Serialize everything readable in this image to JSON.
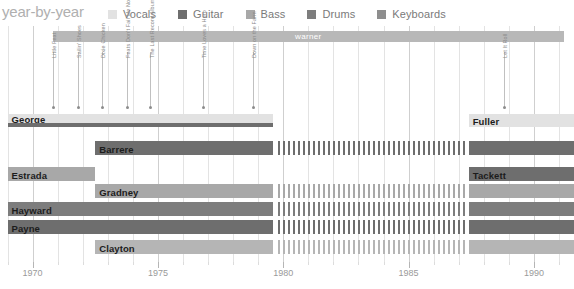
{
  "header": {
    "title": "year-by-year",
    "legend": [
      {
        "label": "Vocals",
        "color": "#e2e2e2"
      },
      {
        "label": "Guitar",
        "color": "#6e6e6e"
      },
      {
        "label": "Bass",
        "color": "#a8a8a8"
      },
      {
        "label": "Drums",
        "color": "#7d7d7d"
      },
      {
        "label": "Keyboards",
        "color": "#8e8e8e"
      }
    ]
  },
  "label_bands": [
    {
      "name": "warner",
      "start_year": 1970.8,
      "end_year": 1991.2,
      "color": "#b8b8b8"
    }
  ],
  "albums": [
    {
      "name": "Little Feat",
      "year": 1970.8
    },
    {
      "name": "Sailin' Shoes",
      "year": 1971.8
    },
    {
      "name": "Dixie Chicken",
      "year": 1972.75
    },
    {
      "name": "Feats Don't Fail Me Now",
      "year": 1973.75
    },
    {
      "name": "The Last Record Album",
      "year": 1974.7
    },
    {
      "name": "Time Loves a Hero",
      "year": 1976.8
    },
    {
      "name": "Down on the Farm",
      "year": 1978.8
    },
    {
      "name": "Let It Roll",
      "year": 1988.8
    }
  ],
  "axis": {
    "ticks_major": [
      1970,
      1975,
      1980,
      1985,
      1990
    ],
    "tick_labels": [
      "1970",
      "1975",
      "1980",
      "1985",
      "1990"
    ],
    "year_min": 1968.7,
    "year_max": 1991.6,
    "minor_step": 1
  },
  "chart_data": {
    "type": "bar",
    "title": "year-by-year",
    "xlabel": "",
    "ylabel": "",
    "xlim": [
      1968.7,
      1991.6
    ],
    "grid": true,
    "legend_position": "top",
    "categories": [
      "George",
      "Barrere",
      "Estrada",
      "Gradney",
      "Hayward",
      "Payne",
      "Clayton",
      "Fuller",
      "Tackett"
    ],
    "series": [
      {
        "name": "Vocals",
        "color": "#e2e2e2"
      },
      {
        "name": "Guitar",
        "color": "#6e6e6e"
      },
      {
        "name": "Bass",
        "color": "#a8a8a8"
      },
      {
        "name": "Drums",
        "color": "#7d7d7d"
      },
      {
        "name": "Keyboards",
        "color": "#8e8e8e"
      }
    ],
    "rows": [
      {
        "member": "George",
        "row": 0,
        "label_on": "vocals",
        "segments": [
          {
            "instrument": "Vocals",
            "color": "#e2e2e2",
            "start": 1969.0,
            "end": 1979.6,
            "y": 0,
            "h": 9,
            "dashed": false
          },
          {
            "instrument": "Guitar",
            "color": "#6e6e6e",
            "start": 1969.0,
            "end": 1979.6,
            "y": 9,
            "h": 4,
            "dashed": false
          }
        ]
      },
      {
        "member": "Barrere",
        "row": 1,
        "label_on": "guitar",
        "segments": [
          {
            "instrument": "Guitar",
            "color": "#6e6e6e",
            "start": 1972.5,
            "end": 1979.6,
            "y": 0,
            "h": 14,
            "dashed": false
          },
          {
            "instrument": "Guitar",
            "color": "#6e6e6e",
            "start": 1979.8,
            "end": 1987.3,
            "y": 0,
            "h": 14,
            "dashed": true
          },
          {
            "instrument": "Guitar",
            "color": "#6e6e6e",
            "start": 1987.4,
            "end": 1991.6,
            "y": 0,
            "h": 14,
            "dashed": false
          }
        ]
      },
      {
        "member": "Estrada",
        "row": 2,
        "label_on": "bass",
        "segments": [
          {
            "instrument": "Bass",
            "color": "#a8a8a8",
            "start": 1969.0,
            "end": 1972.5,
            "y": 0,
            "h": 14,
            "dashed": false
          }
        ]
      },
      {
        "member": "Gradney",
        "row": 3,
        "label_on": "bass",
        "segments": [
          {
            "instrument": "Bass",
            "color": "#a8a8a8",
            "start": 1972.5,
            "end": 1979.6,
            "y": 0,
            "h": 14,
            "dashed": false
          },
          {
            "instrument": "Bass",
            "color": "#a8a8a8",
            "start": 1979.8,
            "end": 1987.3,
            "y": 0,
            "h": 14,
            "dashed": true
          },
          {
            "instrument": "Bass",
            "color": "#a8a8a8",
            "start": 1987.4,
            "end": 1991.6,
            "y": 0,
            "h": 14,
            "dashed": false
          }
        ]
      },
      {
        "member": "Hayward",
        "row": 4,
        "label_on": "drums",
        "segments": [
          {
            "instrument": "Drums",
            "color": "#7d7d7d",
            "start": 1969.0,
            "end": 1979.6,
            "y": 0,
            "h": 14,
            "dashed": false
          },
          {
            "instrument": "Drums",
            "color": "#7d7d7d",
            "start": 1979.8,
            "end": 1987.3,
            "y": 0,
            "h": 14,
            "dashed": true
          },
          {
            "instrument": "Drums",
            "color": "#7d7d7d",
            "start": 1987.4,
            "end": 1991.6,
            "y": 0,
            "h": 14,
            "dashed": false
          }
        ]
      },
      {
        "member": "Payne",
        "row": 5,
        "label_on": "keyboards",
        "segments": [
          {
            "instrument": "Keyboards",
            "color": "#6e6e6e",
            "start": 1969.0,
            "end": 1979.6,
            "y": 0,
            "h": 14,
            "dashed": false
          },
          {
            "instrument": "Keyboards",
            "color": "#6e6e6e",
            "start": 1979.8,
            "end": 1987.3,
            "y": 0,
            "h": 14,
            "dashed": true
          },
          {
            "instrument": "Keyboards",
            "color": "#6e6e6e",
            "start": 1987.4,
            "end": 1991.6,
            "y": 0,
            "h": 14,
            "dashed": false
          }
        ]
      },
      {
        "member": "Clayton",
        "row": 6,
        "label_on": "keyboards",
        "segments": [
          {
            "instrument": "Keyboards",
            "color": "#b5b5b5",
            "start": 1972.5,
            "end": 1979.6,
            "y": 0,
            "h": 14,
            "dashed": false
          },
          {
            "instrument": "Keyboards",
            "color": "#b5b5b5",
            "start": 1979.8,
            "end": 1987.3,
            "y": 0,
            "h": 14,
            "dashed": true
          },
          {
            "instrument": "Keyboards",
            "color": "#b5b5b5",
            "start": 1987.4,
            "end": 1991.6,
            "y": 0,
            "h": 14,
            "dashed": false
          }
        ]
      },
      {
        "member": "Fuller",
        "row": 0,
        "label_on": "vocals",
        "segments": [
          {
            "instrument": "Vocals",
            "color": "#e2e2e2",
            "start": 1987.4,
            "end": 1991.6,
            "y": 0,
            "h": 13,
            "dashed": false
          }
        ]
      },
      {
        "member": "Tackett",
        "row": 2,
        "label_on": "guitar",
        "segments": [
          {
            "instrument": "Guitar",
            "color": "#6e6e6e",
            "start": 1987.4,
            "end": 1991.6,
            "y": 0,
            "h": 14,
            "dashed": false
          }
        ]
      }
    ]
  },
  "layout": {
    "rows_y": [
      114,
      141,
      167,
      184,
      202,
      220,
      240
    ],
    "plot_top": 26
  }
}
